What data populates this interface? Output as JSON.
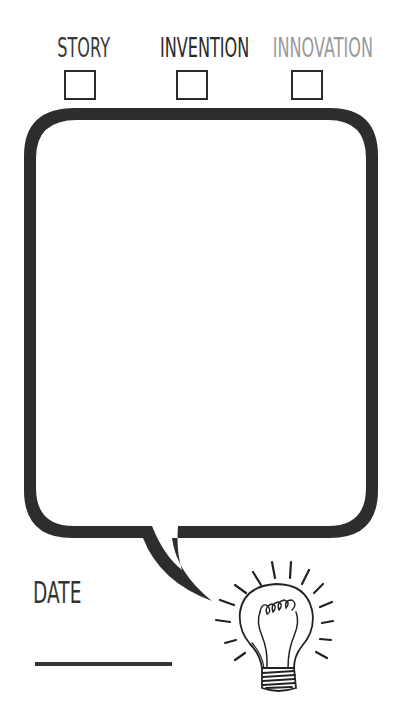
{
  "categories": [
    {
      "label": "STORY",
      "color": "#3a3a3a",
      "checked": false
    },
    {
      "label": "INVENTION",
      "color": "#2a2a2a",
      "checked": false
    },
    {
      "label": "INNOVATION",
      "color": "#9a9a9a",
      "checked": false
    }
  ],
  "bubble": {
    "stroke_color": "#2d2d2d",
    "content": ""
  },
  "date": {
    "label": "DATE",
    "value": ""
  },
  "icons": {
    "illustration": "lightbulb-icon"
  }
}
